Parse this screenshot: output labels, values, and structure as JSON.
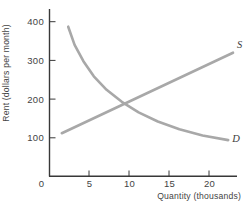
{
  "chart_data": {
    "type": "line",
    "title": "",
    "xlabel": "Quantity (thousands)",
    "ylabel": "Rent (dollars per month)",
    "xlim": [
      0,
      23.5
    ],
    "ylim": [
      0,
      432
    ],
    "x_ticks": [
      5,
      10,
      15,
      20
    ],
    "y_ticks": [
      100,
      200,
      300,
      400
    ],
    "origin_label": "0",
    "grid": false,
    "legend": "none",
    "axis_color": "#383838",
    "curve_color": "#a8a8a8",
    "text_color": "#444444",
    "equilibrium": {
      "quantity_thousands": 10,
      "rent_dollars_per_month": 200
    },
    "series": [
      {
        "name": "supply",
        "label": "S",
        "points": [
          [
            1.6,
            112
          ],
          [
            23.0,
            320
          ]
        ]
      },
      {
        "name": "demand",
        "label": "D",
        "points": [
          [
            2.4,
            387
          ],
          [
            3.2,
            340
          ],
          [
            4.3,
            298
          ],
          [
            5.6,
            259
          ],
          [
            7.2,
            224
          ],
          [
            9.1,
            193
          ],
          [
            11.2,
            166
          ],
          [
            13.6,
            142
          ],
          [
            16.3,
            122
          ],
          [
            19.2,
            106
          ],
          [
            22.4,
            94
          ]
        ]
      }
    ]
  }
}
